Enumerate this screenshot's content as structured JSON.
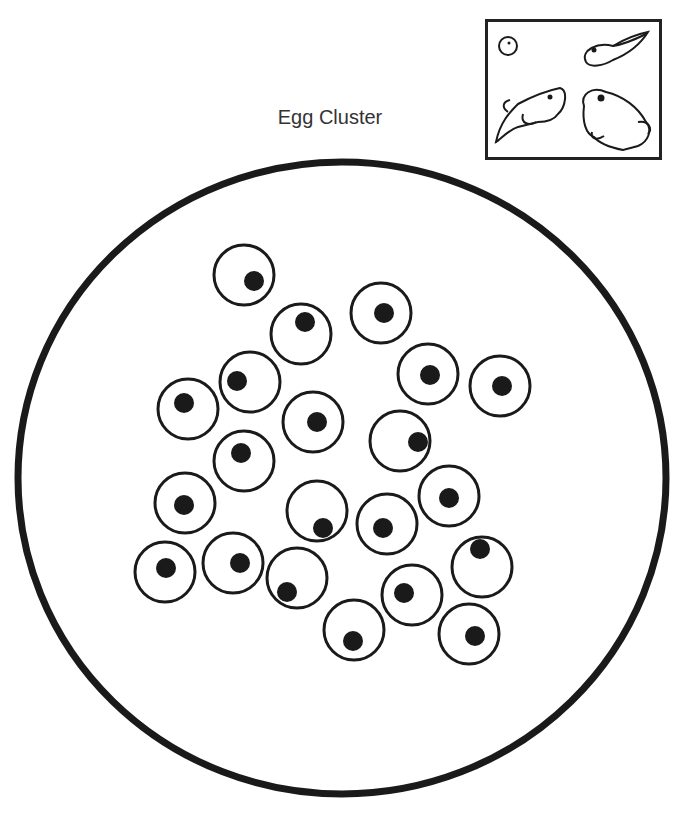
{
  "title": "Egg Cluster",
  "colors": {
    "stroke": "#1a1a1a",
    "fill": "#1a1a1a",
    "background": "#ffffff"
  },
  "inset": {
    "stages": [
      "egg-icon",
      "tadpole-icon",
      "froglet-icon",
      "frog-icon"
    ]
  },
  "cluster": {
    "outline": {
      "cx": 342,
      "cy": 478,
      "rx": 324,
      "ry": 316
    },
    "eggs": [
      {
        "cx": 244,
        "cy": 275,
        "dx": 254,
        "dy": 281
      },
      {
        "cx": 301,
        "cy": 334,
        "dx": 305,
        "dy": 322
      },
      {
        "cx": 381,
        "cy": 313,
        "dx": 384,
        "dy": 313
      },
      {
        "cx": 428,
        "cy": 374,
        "dx": 430,
        "dy": 375
      },
      {
        "cx": 500,
        "cy": 386,
        "dx": 502,
        "dy": 386
      },
      {
        "cx": 250,
        "cy": 382,
        "dx": 237,
        "dy": 381
      },
      {
        "cx": 188,
        "cy": 409,
        "dx": 184,
        "dy": 403
      },
      {
        "cx": 313,
        "cy": 422,
        "dx": 317,
        "dy": 422
      },
      {
        "cx": 400,
        "cy": 441,
        "dx": 418,
        "dy": 442
      },
      {
        "cx": 244,
        "cy": 461,
        "dx": 241,
        "dy": 453
      },
      {
        "cx": 185,
        "cy": 503,
        "dx": 184,
        "dy": 505
      },
      {
        "cx": 317,
        "cy": 511,
        "dx": 323,
        "dy": 528
      },
      {
        "cx": 449,
        "cy": 496,
        "dx": 449,
        "dy": 498
      },
      {
        "cx": 387,
        "cy": 524,
        "dx": 383,
        "dy": 528
      },
      {
        "cx": 165,
        "cy": 572,
        "dx": 166,
        "dy": 568
      },
      {
        "cx": 233,
        "cy": 563,
        "dx": 240,
        "dy": 563
      },
      {
        "cx": 297,
        "cy": 578,
        "dx": 287,
        "dy": 592
      },
      {
        "cx": 482,
        "cy": 567,
        "dx": 480,
        "dy": 549
      },
      {
        "cx": 412,
        "cy": 595,
        "dx": 404,
        "dy": 593
      },
      {
        "cx": 354,
        "cy": 630,
        "dx": 353,
        "dy": 641
      },
      {
        "cx": 469,
        "cy": 634,
        "dx": 475,
        "dy": 636
      }
    ]
  }
}
